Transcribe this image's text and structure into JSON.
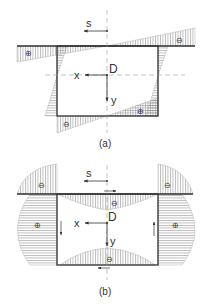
{
  "diagram_a": {
    "caption": "(a)",
    "origin_label": "D",
    "x_axis_label": "x",
    "y_axis_label": "y",
    "s_label": "s",
    "signs": {
      "top_left": "⊕",
      "top_right": "⊖",
      "bottom_left": "⊖",
      "bottom_right": "⊕"
    }
  },
  "diagram_b": {
    "caption": "(b)",
    "origin_label": "D",
    "x_axis_label": "x",
    "y_axis_label": "y",
    "s_label": "s",
    "signs": {
      "top_left_flange": "⊖",
      "top_right_flange": "⊖",
      "left_web": "⊕",
      "right_web": "⊕",
      "top_inner": "⊖",
      "bottom_inner": "⊖"
    }
  },
  "colors": {
    "line": "#333333",
    "hatch": "#8a8a8a",
    "outline": "#b0b0b0",
    "dash": "#999999"
  }
}
